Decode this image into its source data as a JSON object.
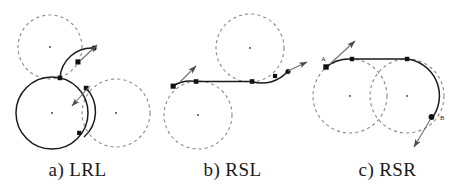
{
  "figure": {
    "background_color": "#ffffff",
    "dashed_circle_color": "#8c8c8c",
    "path_color": "#1a1a1a",
    "node_color": "#111111",
    "arrow_color": "#6f6f6f",
    "label_color": "#1a1a1a"
  },
  "panels": [
    {
      "id": "a",
      "caption": "a) LRL",
      "path_type": "LRL",
      "circles": [
        {
          "name": "turn-circle-left-start",
          "cx": 50,
          "cy": 47,
          "r": 32,
          "style": "dashed"
        },
        {
          "name": "turn-circle-middle",
          "cx": 52,
          "cy": 113,
          "r": 36,
          "style": "solid-traversed"
        },
        {
          "name": "turn-circle-left-end",
          "cx": 116,
          "cy": 113,
          "r": 34,
          "style": "dashed"
        }
      ],
      "centers": [
        {
          "cx": 50,
          "cy": 47
        },
        {
          "cx": 52,
          "cy": 113
        },
        {
          "cx": 116,
          "cy": 113
        }
      ],
      "nodes": [
        {
          "name": "start-node",
          "cx": 94,
          "cy": 48
        },
        {
          "name": "tangent-node-1",
          "cx": 78,
          "cy": 62
        },
        {
          "name": "tangent-node-2",
          "cx": 60,
          "cy": 78
        },
        {
          "name": "tangent-node-3",
          "cx": 86,
          "cy": 88
        },
        {
          "name": "end-node",
          "cx": 79,
          "cy": 133
        }
      ],
      "arrows": [
        {
          "name": "start-heading-arrow",
          "x1": 80,
          "y1": 61,
          "x2": 97,
          "y2": 45
        },
        {
          "name": "end-heading-arrow",
          "x1": 90,
          "y1": 86,
          "x2": 72,
          "y2": 106
        }
      ],
      "labels": []
    },
    {
      "id": "b",
      "caption": "b) RSL",
      "path_type": "RSL",
      "circles": [
        {
          "name": "turn-circle-right-start",
          "cx": 198,
          "cy": 115,
          "r": 34,
          "style": "dashed"
        },
        {
          "name": "turn-circle-left-end",
          "cx": 250,
          "cy": 48,
          "r": 34,
          "style": "dashed"
        }
      ],
      "centers": [
        {
          "cx": 198,
          "cy": 115
        },
        {
          "cx": 250,
          "cy": 48
        }
      ],
      "nodes": [
        {
          "name": "start-node",
          "cx": 173,
          "cy": 86
        },
        {
          "name": "tangent-node-1",
          "cx": 196,
          "cy": 81
        },
        {
          "name": "tangent-node-2",
          "cx": 252,
          "cy": 81
        },
        {
          "name": "tangent-node-3",
          "cx": 275,
          "cy": 76
        },
        {
          "name": "end-node",
          "cx": 288,
          "cy": 71
        }
      ],
      "arrows": [
        {
          "name": "start-heading-arrow",
          "x1": 180,
          "y1": 82,
          "x2": 196,
          "y2": 66
        },
        {
          "name": "end-heading-arrow",
          "x1": 288,
          "y1": 71,
          "x2": 307,
          "y2": 62
        }
      ],
      "labels": []
    },
    {
      "id": "c",
      "caption": "c) RSR",
      "path_type": "RSR",
      "circles": [
        {
          "name": "turn-circle-right-start",
          "cx": 350,
          "cy": 96,
          "r": 37,
          "style": "dashed"
        },
        {
          "name": "turn-circle-right-end",
          "cx": 407,
          "cy": 96,
          "r": 37,
          "style": "dashed"
        }
      ],
      "centers": [
        {
          "cx": 350,
          "cy": 96
        },
        {
          "cx": 407,
          "cy": 96
        }
      ],
      "nodes": [
        {
          "name": "start-node",
          "cx": 326,
          "cy": 67
        },
        {
          "name": "tangent-node-1",
          "cx": 352,
          "cy": 59
        },
        {
          "name": "tangent-node-2",
          "cx": 407,
          "cy": 59
        },
        {
          "name": "end-node",
          "cx": 432,
          "cy": 117
        }
      ],
      "arrows": [
        {
          "name": "start-heading-arrow",
          "x1": 330,
          "y1": 64,
          "x2": 355,
          "y2": 41
        },
        {
          "name": "end-heading-arrow",
          "x1": 430,
          "y1": 120,
          "x2": 414,
          "y2": 147
        }
      ],
      "labels": [
        {
          "name": "point-label-a",
          "text": "A",
          "x": 321,
          "y": 61
        },
        {
          "name": "point-label-b",
          "text": "B",
          "x": 440,
          "y": 120
        }
      ]
    }
  ]
}
